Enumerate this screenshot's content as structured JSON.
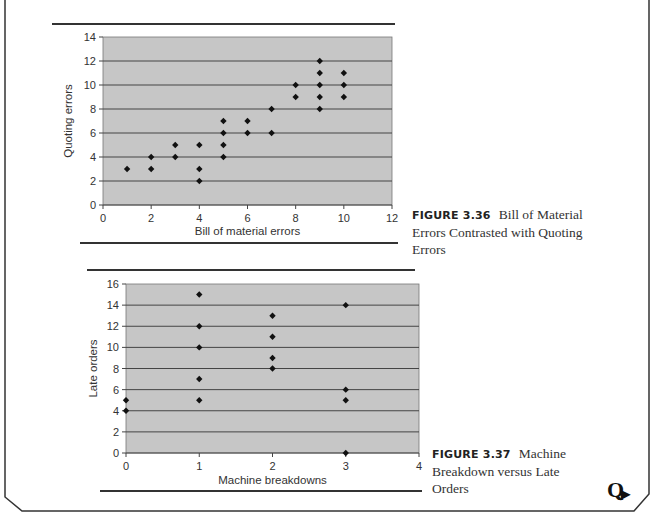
{
  "page": {
    "logo_glyph": "Q"
  },
  "figures": [
    {
      "label": "FIGURE 3.36",
      "caption": "Bill of Material Errors Contrasted with Quoting Errors"
    },
    {
      "label": "FIGURE 3.37",
      "caption": "Machine Breakdown versus Late Orders"
    }
  ],
  "chart_data": [
    {
      "type": "scatter",
      "title": "Bill of Material Errors Contrasted with Quoting Errors",
      "xlabel": "Bill of material errors",
      "ylabel": "Quoting errors",
      "xlim": [
        0,
        12
      ],
      "ylim": [
        0,
        14
      ],
      "xticks": [
        0,
        2,
        4,
        6,
        8,
        10,
        12
      ],
      "yticks": [
        0,
        2,
        4,
        6,
        8,
        10,
        12,
        14
      ],
      "grid": "horizontal",
      "background": "#c6c6c6",
      "points": [
        [
          1,
          3
        ],
        [
          2,
          4
        ],
        [
          2,
          3
        ],
        [
          3,
          5
        ],
        [
          3,
          4
        ],
        [
          4,
          5
        ],
        [
          4,
          3
        ],
        [
          4,
          2
        ],
        [
          5,
          7
        ],
        [
          5,
          6
        ],
        [
          5,
          5
        ],
        [
          5,
          4
        ],
        [
          6,
          7
        ],
        [
          6,
          6
        ],
        [
          7,
          8
        ],
        [
          7,
          6
        ],
        [
          8,
          10
        ],
        [
          8,
          9
        ],
        [
          9,
          12
        ],
        [
          9,
          11
        ],
        [
          9,
          10
        ],
        [
          9,
          9
        ],
        [
          9,
          8
        ],
        [
          10,
          11
        ],
        [
          10,
          10
        ],
        [
          10,
          9
        ]
      ]
    },
    {
      "type": "scatter",
      "title": "Machine Breakdown versus Late Orders",
      "xlabel": "Machine breakdowns",
      "ylabel": "Late orders",
      "xlim": [
        0,
        4
      ],
      "ylim": [
        0,
        16
      ],
      "xticks": [
        0,
        1,
        2,
        3,
        4
      ],
      "yticks": [
        0,
        2,
        4,
        6,
        8,
        10,
        12,
        14,
        16
      ],
      "grid": "horizontal",
      "background": "#c6c6c6",
      "points": [
        [
          0,
          5
        ],
        [
          0,
          4
        ],
        [
          1,
          15
        ],
        [
          1,
          12
        ],
        [
          1,
          10
        ],
        [
          1,
          7
        ],
        [
          1,
          5
        ],
        [
          2,
          13
        ],
        [
          2,
          11
        ],
        [
          2,
          9
        ],
        [
          2,
          8
        ],
        [
          3,
          14
        ],
        [
          3,
          6
        ],
        [
          3,
          5
        ],
        [
          3,
          0
        ]
      ]
    }
  ]
}
